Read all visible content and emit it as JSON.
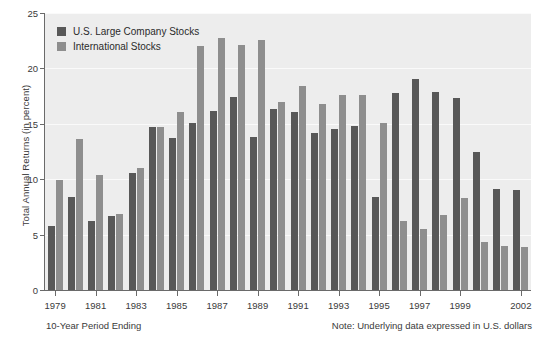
{
  "chart_data": {
    "type": "bar",
    "title": "",
    "xlabel": "10-Year Period Ending",
    "ylabel": "Total Annual Returns (in percent)",
    "ylim": [
      0,
      25
    ],
    "yticks": [
      0,
      5,
      10,
      15,
      20,
      25
    ],
    "grid": true,
    "legend_position": "upper-left",
    "categories": [
      "1979",
      "1980",
      "1981",
      "1982",
      "1983",
      "1984",
      "1985",
      "1986",
      "1987",
      "1988",
      "1989",
      "1990",
      "1991",
      "1992",
      "1993",
      "1994",
      "1995",
      "1996",
      "1997",
      "1998",
      "1999",
      "2000",
      "2001",
      "2002"
    ],
    "tick_labels": [
      "1979",
      "",
      "1981",
      "",
      "1983",
      "",
      "1985",
      "",
      "1987",
      "",
      "1989",
      "",
      "1991",
      "",
      "1993",
      "",
      "1995",
      "",
      "1997",
      "",
      "1999",
      "",
      "",
      "2002"
    ],
    "series": [
      {
        "name": "U.S. Large Company Stocks",
        "color": "#585858",
        "values": [
          5.8,
          8.4,
          6.2,
          6.7,
          10.6,
          14.7,
          13.7,
          15.1,
          16.2,
          17.4,
          13.8,
          16.3,
          16.1,
          14.2,
          14.5,
          14.8,
          8.4,
          17.8,
          19.0,
          17.9,
          17.3,
          12.5,
          9.1,
          9.0
        ],
        "unit": "percent"
      },
      {
        "name": "International Stocks",
        "color": "#8e8e8e",
        "values": [
          9.9,
          13.6,
          10.4,
          6.9,
          11.0,
          14.7,
          16.1,
          22.0,
          22.7,
          22.1,
          22.6,
          17.0,
          18.4,
          16.8,
          17.6,
          17.6,
          15.1,
          6.2,
          5.5,
          6.8,
          8.3,
          4.3,
          4.0,
          3.9
        ],
        "unit": "percent"
      }
    ]
  },
  "legend": {
    "items": [
      {
        "label": "U.S. Large Company Stocks",
        "color": "#585858"
      },
      {
        "label": "International Stocks",
        "color": "#8e8e8e"
      }
    ]
  },
  "axes": {
    "y_title": "Total Annual Returns (in percent)",
    "y_tick_labels": [
      "0",
      "5",
      "10",
      "15",
      "20",
      "25"
    ],
    "x_title": "10-Year Period Ending"
  },
  "notes": {
    "source": "Note: Underlying data expressed in U.S. dollars"
  },
  "colors": {
    "plot_background": "#ededed",
    "gridline": "#fafafa",
    "axis": "#6a6a6a",
    "us_bar": "#585858",
    "intl_bar": "#8e8e8e",
    "page_background": "#ffffff"
  }
}
